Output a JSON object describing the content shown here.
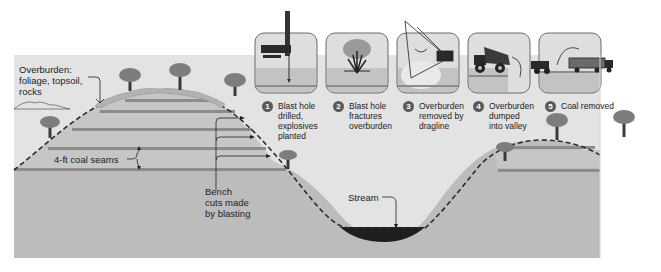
{
  "diagram": {
    "title_hidden": "Mountaintop removal coal mining cross-section",
    "colors": {
      "page_bg": "#ffffff",
      "sky": "#e3e3e3",
      "ground": "#bcbcbc",
      "ground_light": "#c9c9c9",
      "coal_seam": "#8c8c8c",
      "overburden": "#b0b0b0",
      "dashed_profile": "#2b2b2b",
      "stream": "#1e1e1e",
      "tree_canopy": "#7d7d7d",
      "tree_trunk": "#3a3a3a",
      "panel_bg": "#d9d9d9",
      "panel_border": "#6a6a6a"
    },
    "labels": {
      "overburden_line1": "Overburden:",
      "overburden_line2": "foliage, topsoil,",
      "overburden_line3": "rocks",
      "coal_seams": "4-ft coal seams",
      "bench_line1": "Bench",
      "bench_line2": "cuts made",
      "bench_line3": "by blasting",
      "stream": "Stream"
    },
    "steps": [
      {
        "number": "1",
        "lines": [
          "Blast hole",
          "drilled,",
          "explosives",
          "planted"
        ],
        "icon": "drill-rig-icon"
      },
      {
        "number": "2",
        "lines": [
          "Blast hole",
          "fractures",
          "overburden"
        ],
        "icon": "explosion-icon"
      },
      {
        "number": "3",
        "lines": [
          "Overburden",
          "removed by",
          "dragline"
        ],
        "icon": "dragline-icon"
      },
      {
        "number": "4",
        "lines": [
          "Overburden",
          "dumped",
          "into valley"
        ],
        "icon": "dump-truck-icon"
      },
      {
        "number": "5",
        "lines": [
          "Coal removed"
        ],
        "icon": "coal-truck-icon"
      }
    ]
  }
}
